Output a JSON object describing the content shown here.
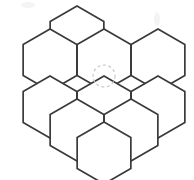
{
  "figure": {
    "title": "Honeycomb hexagon grid",
    "width": 194,
    "height": 180,
    "background_color": "#ffffff",
    "line_color": "#3a3a3a",
    "line_width": 1.7,
    "hexagon_count": 10,
    "hexagon_orientation": "pointy-top",
    "hexagon_radius": 31,
    "caption": ""
  },
  "chart_data": {
    "type": "diagram",
    "title": "Honeycomb hexagon grid",
    "xlabel": "",
    "ylabel": "",
    "xlim": [
      0,
      194
    ],
    "ylim": [
      0,
      180
    ],
    "grid": false,
    "legend": "none",
    "hexagons": [
      {
        "id": "hex-r0-c0",
        "row": 0,
        "col": 0,
        "cx": 77,
        "cy": 37,
        "r": 31
      },
      {
        "id": "hex-r1-c0",
        "row": 1,
        "col": 0,
        "cx": 50,
        "cy": 60,
        "r": 31
      },
      {
        "id": "hex-r1-c1",
        "row": 1,
        "col": 1,
        "cx": 104,
        "cy": 60,
        "r": 31
      },
      {
        "id": "hex-r1-c2",
        "row": 1,
        "col": 2,
        "cx": 158,
        "cy": 60,
        "r": 31
      },
      {
        "id": "hex-r2-c0",
        "row": 2,
        "col": 0,
        "cx": 50,
        "cy": 107,
        "r": 31
      },
      {
        "id": "hex-r2-c1",
        "row": 2,
        "col": 1,
        "cx": 104,
        "cy": 107,
        "r": 31
      },
      {
        "id": "hex-r2-c2",
        "row": 2,
        "col": 2,
        "cx": 158,
        "cy": 107,
        "r": 31
      },
      {
        "id": "hex-r3-c0",
        "row": 3,
        "col": 0,
        "cx": 77,
        "cy": 130,
        "r": 31
      },
      {
        "id": "hex-r3-c1",
        "row": 3,
        "col": 1,
        "cx": 131,
        "cy": 130,
        "r": 31
      },
      {
        "id": "hex-r4-c0",
        "row": 4,
        "col": 0,
        "cx": 104,
        "cy": 153,
        "r": 31
      }
    ],
    "annotations": [
      {
        "id": "marker-circle",
        "shape": "circle-dashed",
        "cx": 104,
        "cy": 76,
        "r": 11,
        "color": "#c9c9c9",
        "label": ""
      },
      {
        "id": "smudge-top-left",
        "shape": "smudge",
        "cx": 28,
        "cy": 5,
        "rx": 7,
        "ry": 3,
        "color": "#f4f4f4",
        "label": ""
      },
      {
        "id": "smudge-top-right",
        "shape": "smudge",
        "cx": 157,
        "cy": 19,
        "rx": 3,
        "ry": 7,
        "color": "#f2f2f2",
        "label": ""
      }
    ]
  }
}
